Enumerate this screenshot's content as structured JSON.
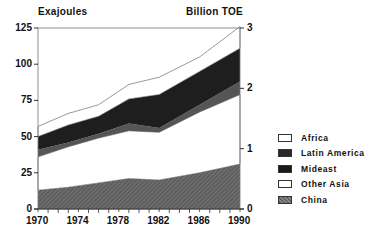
{
  "chart_data": {
    "type": "area",
    "stacked": true,
    "title": "",
    "ylabel_left": "Exajoules",
    "ylabel_right": "Billion TOE",
    "xlabel": "",
    "x": [
      1970,
      1973,
      1976,
      1979,
      1982,
      1986,
      1990
    ],
    "xticks": [
      "1970",
      "1974",
      "1978",
      "1982",
      "1986",
      "1990"
    ],
    "yticks_left": [
      "0",
      "25",
      "50",
      "75",
      "100",
      "125"
    ],
    "yticks_right": [
      "0",
      "1",
      "2",
      "3"
    ],
    "ylim": [
      0,
      125
    ],
    "grid": false,
    "legend_position": "right",
    "series": [
      {
        "name": "China",
        "values": [
          13,
          15,
          18,
          21,
          20,
          25,
          31
        ],
        "fill": "#6a6a6a",
        "pattern": "hatch"
      },
      {
        "name": "Other Asia",
        "values": [
          23,
          28,
          31,
          33,
          33,
          42,
          48
        ],
        "fill": "#ffffff"
      },
      {
        "name": "Mideast",
        "values": [
          5,
          3,
          3,
          5,
          3,
          5,
          9
        ],
        "fill": "#555555"
      },
      {
        "name": "Latin America",
        "values": [
          9,
          12,
          12,
          17,
          23,
          23,
          23
        ],
        "fill": "#1e1e1e"
      },
      {
        "name": "Africa",
        "values": [
          7,
          8,
          8,
          10,
          12,
          10,
          15
        ],
        "fill": "#ffffff"
      }
    ],
    "cumulative_tops": {
      "China": [
        13,
        15,
        18,
        21,
        20,
        25,
        31
      ],
      "Other Asia": [
        36,
        43,
        49,
        54,
        53,
        67,
        79
      ],
      "Mideast": [
        41,
        46,
        52,
        59,
        56,
        72,
        88
      ],
      "Latin America": [
        50,
        58,
        64,
        76,
        79,
        95,
        111
      ],
      "Africa": [
        57,
        66,
        72,
        86,
        91,
        105,
        126
      ]
    }
  },
  "legend": [
    {
      "label": "Africa",
      "swatch": "#ffffff"
    },
    {
      "label": "Latin America",
      "swatch": "#2a2a2a"
    },
    {
      "label": "Mideast",
      "swatch": "#1a1a1a"
    },
    {
      "label": "Other Asia",
      "swatch": "#ffffff"
    },
    {
      "label": "China",
      "swatch": "#777777"
    }
  ]
}
